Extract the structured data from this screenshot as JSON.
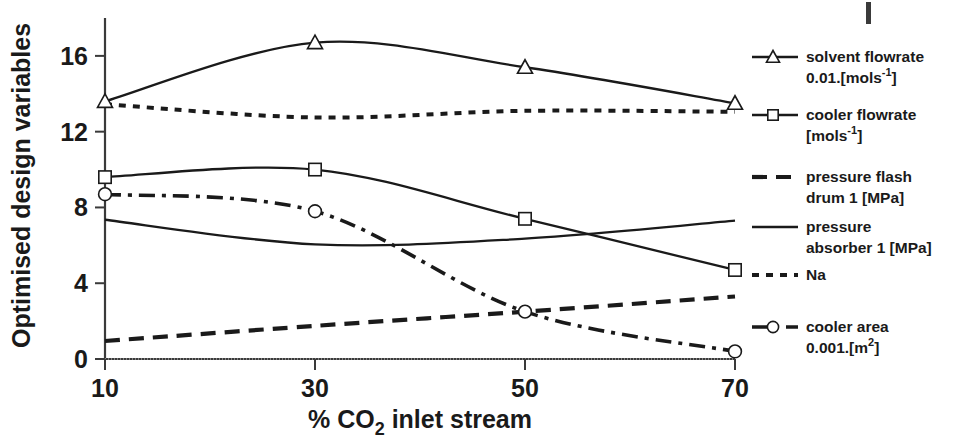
{
  "chart_data": {
    "type": "line",
    "title": "",
    "xlabel": "% CO2 inlet stream",
    "xlabel_parts": {
      "pre": "% CO",
      "sub": "2",
      "post": " inlet stream"
    },
    "ylabel": "Optimised design variables",
    "x": [
      10,
      30,
      50,
      70
    ],
    "xticklabels": [
      "10",
      "30",
      "50",
      "70"
    ],
    "yticklabels": [
      "0",
      "4",
      "8",
      "12",
      "16"
    ],
    "yticks": [
      0,
      4,
      8,
      12,
      16
    ],
    "xlim": [
      10,
      70
    ],
    "ylim": [
      0,
      18
    ],
    "grid": false,
    "legend_position": "right",
    "series": [
      {
        "name": "solvent flowrate 0.01.[mols-1]",
        "label_line1": "solvent flowrate",
        "label_line2_pre": "0.01.[mols",
        "label_line2_sup": "-1",
        "label_line2_post": "]",
        "values": [
          13.6,
          16.7,
          15.4,
          13.5
        ],
        "style": "solid",
        "marker": "triangle"
      },
      {
        "name": "cooler flowrate [mols-1]",
        "label_line1": "cooler flowrate",
        "label_line2_pre": "[mols",
        "label_line2_sup": "-1",
        "label_line2_post": "]",
        "values": [
          9.6,
          10.0,
          7.4,
          4.7
        ],
        "style": "solid",
        "marker": "square"
      },
      {
        "name": "pressure flash drum 1 [MPa]",
        "label_line1": "pressure flash",
        "label_line2_pre": "drum 1 [MPa]",
        "label_line2_sup": "",
        "label_line2_post": "",
        "values": [
          0.95,
          1.75,
          2.5,
          3.3
        ],
        "style": "dashed",
        "marker": "none"
      },
      {
        "name": "pressure absorber 1 [MPa]",
        "label_line1": "pressure",
        "label_line2_pre": "absorber 1 [MPa]",
        "label_line2_sup": "",
        "label_line2_post": "",
        "values": [
          7.35,
          6.05,
          6.35,
          7.3
        ],
        "style": "solid",
        "marker": "none"
      },
      {
        "name": "Na",
        "label_line1": "Na",
        "label_line2_pre": "",
        "label_line2_sup": "",
        "label_line2_post": "",
        "values": [
          13.45,
          12.75,
          13.1,
          13.05
        ],
        "style": "dotted",
        "marker": "none"
      },
      {
        "name": "cooler area 0.001.[m2]",
        "label_line1": "cooler area",
        "label_line2_pre": "0.001.[m",
        "label_line2_sup": "2",
        "label_line2_post": "]",
        "values": [
          8.7,
          7.8,
          2.5,
          0.4
        ],
        "style": "dashdot",
        "marker": "circle"
      }
    ]
  },
  "colors": {
    "line": "#1a1a1a",
    "axis": "#3a3a3a",
    "background": "#ffffff",
    "marker_fill": "#ffffff"
  }
}
